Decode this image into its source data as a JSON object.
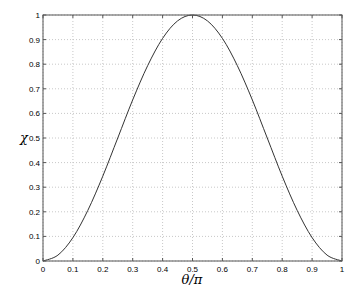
{
  "chart_data": {
    "type": "line",
    "title": "",
    "xlabel": "θ/π",
    "ylabel": "χ",
    "xlim": [
      0,
      1
    ],
    "ylim": [
      0,
      1
    ],
    "grid": true,
    "legend": null,
    "xticks": [
      "0",
      "0.1",
      "0.2",
      "0.3",
      "0.4",
      "0.5",
      "0.6",
      "0.7",
      "0.8",
      "0.9",
      "1"
    ],
    "yticks": [
      "0",
      "0.1",
      "0.2",
      "0.3",
      "0.4",
      "0.5",
      "0.6",
      "0.7",
      "0.8",
      "0.9",
      "1"
    ],
    "series": [
      {
        "name": "χ",
        "color": "#333333",
        "x": [
          0,
          0.05,
          0.1,
          0.15,
          0.2,
          0.25,
          0.3,
          0.35,
          0.4,
          0.45,
          0.5,
          0.55,
          0.6,
          0.65,
          0.7,
          0.75,
          0.8,
          0.85,
          0.9,
          0.95,
          1
        ],
        "y": [
          0,
          0.024,
          0.095,
          0.206,
          0.345,
          0.5,
          0.655,
          0.794,
          0.905,
          0.976,
          1,
          0.976,
          0.905,
          0.794,
          0.655,
          0.5,
          0.345,
          0.206,
          0.095,
          0.024,
          0
        ]
      }
    ]
  },
  "colors": {
    "axes": "#555555",
    "grid": "#c8c8c8",
    "line": "#333333"
  }
}
